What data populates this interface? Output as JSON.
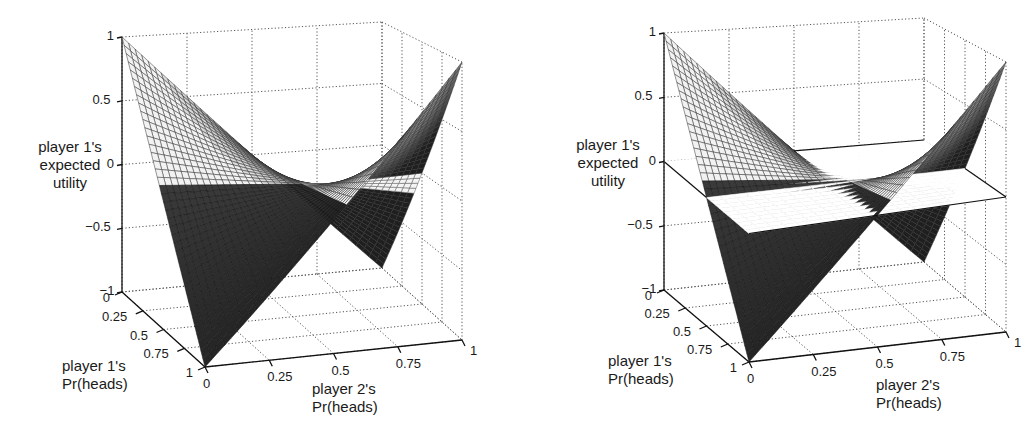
{
  "chart_data": [
    {
      "type": "surface3d",
      "title": "",
      "function": "u = (2*p1 - 1) * (2*p2 - 1)",
      "zlabel": "player 1's expected utility",
      "xlabel": "player 2's Pr(heads)",
      "ylabel": "player 1's Pr(heads)",
      "zlim": [
        -1,
        1
      ],
      "xlim": [
        0,
        1
      ],
      "ylim": [
        0,
        1
      ],
      "z_ticks": [
        "1",
        "0.5",
        "0",
        "−0.5",
        "−1"
      ],
      "x_ticks": [
        "0",
        "0.25",
        "0.5",
        "0.75",
        "1"
      ],
      "y_ticks": [
        "0",
        "0.25",
        "0.5",
        "0.75",
        "1"
      ],
      "grid": true,
      "corner_values": [
        {
          "p1": 0,
          "p2": 0,
          "u": 1
        },
        {
          "p1": 1,
          "p2": 1,
          "u": 1
        },
        {
          "p1": 1,
          "p2": 0,
          "u": -1
        },
        {
          "p1": 0,
          "p2": 1,
          "u": -1
        }
      ],
      "saddle_point": {
        "p1": 0.5,
        "p2": 0.5,
        "u": 0
      },
      "reference_plane": null
    },
    {
      "type": "surface3d",
      "title": "",
      "function": "u = (2*p1 - 1) * (2*p2 - 1)",
      "zlabel": "player 1's expected utility",
      "xlabel": "player 2's Pr(heads)",
      "ylabel": "player 1's Pr(heads)",
      "zlim": [
        -1,
        1
      ],
      "xlim": [
        0,
        1
      ],
      "ylim": [
        0,
        1
      ],
      "z_ticks": [
        "1",
        "0.5",
        "0",
        "−0.5",
        "−1"
      ],
      "x_ticks": [
        "0",
        "0.25",
        "0.5",
        "0.75",
        "1"
      ],
      "y_ticks": [
        "0",
        "0.25",
        "0.5",
        "0.75",
        "1"
      ],
      "grid": true,
      "corner_values": [
        {
          "p1": 0,
          "p2": 0,
          "u": 1
        },
        {
          "p1": 1,
          "p2": 1,
          "u": 1
        },
        {
          "p1": 1,
          "p2": 0,
          "u": -1
        },
        {
          "p1": 0,
          "p2": 1,
          "u": -1
        }
      ],
      "saddle_point": {
        "p1": 0.5,
        "p2": 0.5,
        "u": 0
      },
      "reference_plane": {
        "z": 0,
        "color": "#ffffff"
      }
    }
  ],
  "labels": {
    "z_axis": [
      "player 1's",
      "expected",
      "utility"
    ],
    "p1_axis": [
      "player 1's",
      "Pr(heads)"
    ],
    "p2_axis": [
      "player 2's",
      "Pr(heads)"
    ]
  },
  "ticks": {
    "z": [
      "1",
      "0.5",
      "0",
      "−0.5",
      "−1"
    ],
    "p1": [
      "0",
      "0.25",
      "0.5",
      "0.75",
      "1"
    ],
    "p2": [
      "0",
      "0.25",
      "0.5",
      "0.75",
      "1"
    ]
  },
  "projection": {
    "left": {
      "origin_top": [
        122,
        37
      ],
      "origin_bottom": [
        122,
        292
      ],
      "front_bottom": [
        205,
        367
      ],
      "right_bottom": [
        462,
        340
      ],
      "back_bottom": [
        382,
        268
      ],
      "back_top": [
        357,
        22
      ],
      "right_top": [
        462,
        62
      ]
    },
    "right": {
      "origin_top": [
        147,
        33
      ],
      "origin_bottom": [
        147,
        290
      ],
      "front_bottom": [
        232,
        362
      ],
      "right_bottom": [
        489,
        332
      ],
      "back_bottom": [
        407,
        262
      ],
      "back_top": [
        384,
        18
      ],
      "right_top": [
        490,
        62
      ]
    }
  },
  "colors": {
    "mesh_line": "#2a2a2a",
    "dark_face": "#1e1e1e",
    "light_face": "#ffffff",
    "grid": "#555555",
    "axis": "#111111",
    "plane": "#ffffff"
  }
}
